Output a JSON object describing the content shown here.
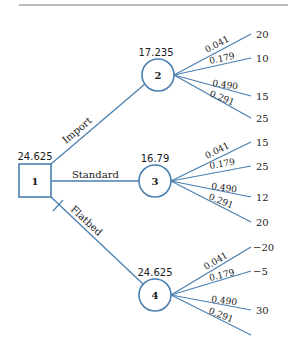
{
  "colors": {
    "line": "#4a7fb0",
    "text": "#1a1a1a",
    "rule": "#7a7a7a"
  },
  "decision_node": {
    "id": "1",
    "value": "24.625"
  },
  "alternatives": [
    {
      "label": "Import",
      "pruned": false
    },
    {
      "label": "Standard",
      "pruned": false
    },
    {
      "label": "Flatbed",
      "pruned": true
    }
  ],
  "chance_nodes": [
    {
      "id": "2",
      "value": "17.235",
      "branches": [
        {
          "prob": "0.041",
          "payoff": "20"
        },
        {
          "prob": "0.179",
          "payoff": "10"
        },
        {
          "prob": "0.490",
          "payoff": "15"
        },
        {
          "prob": "0.291",
          "payoff": "25"
        }
      ]
    },
    {
      "id": "3",
      "value": "16.79",
      "branches": [
        {
          "prob": "0.041",
          "payoff": "15"
        },
        {
          "prob": "0.179",
          "payoff": "25"
        },
        {
          "prob": "0.490",
          "payoff": "12"
        },
        {
          "prob": "0.291",
          "payoff": "20"
        }
      ]
    },
    {
      "id": "4",
      "value": "24.625",
      "branches": [
        {
          "prob": "0.041",
          "payoff": "−20"
        },
        {
          "prob": "0.179",
          "payoff": "−5"
        },
        {
          "prob": "0.490",
          "payoff": "30"
        },
        {
          "prob": "0.291",
          "payoff": ""
        }
      ]
    }
  ]
}
